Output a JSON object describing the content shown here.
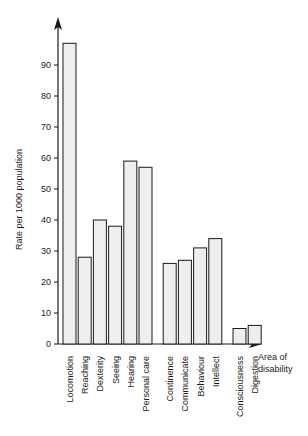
{
  "chart_data": {
    "type": "bar",
    "title": "",
    "xlabel": "Area of disability",
    "ylabel": "Rate per 1000 population",
    "categories": [
      "Locomotion",
      "Reaching",
      "Dexterity",
      "Seeing",
      "Hearing",
      "Personal care",
      "Continence",
      "Communicate",
      "Behaviour",
      "Intellect",
      "Consciousness",
      "Digestion"
    ],
    "values": [
      97,
      28,
      40,
      38,
      59,
      57,
      26,
      27,
      31,
      34,
      5,
      6
    ],
    "ylim": [
      0,
      100
    ],
    "yticks": [
      0,
      10,
      20,
      30,
      40,
      50,
      60,
      70,
      80,
      90
    ],
    "ytick_labels": [
      "0",
      "10",
      "20",
      "30",
      "40",
      "50",
      "60",
      "70",
      "80",
      "90"
    ],
    "xticks_shown": false,
    "grid": false,
    "legend": null,
    "group_breaks": [
      6,
      10
    ],
    "bar_fill": "#eeeeee",
    "bar_stroke": "#1a1a1a",
    "axis_color": "#1a1a1a"
  },
  "axis": {
    "y_title": "Rate per 1000 population",
    "x_title_line1": "Area of",
    "x_title_line2": "disability"
  }
}
